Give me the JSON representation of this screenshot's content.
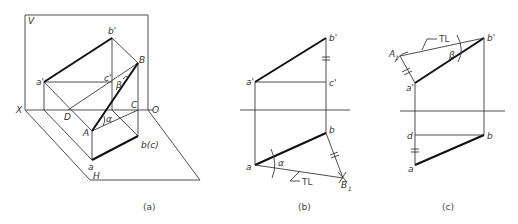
{
  "figure": {
    "panels": [
      {
        "id": "a",
        "caption": "(a)",
        "labels": {
          "V": "V",
          "H": "H",
          "X": "X",
          "O": "O",
          "a_prime": "a'",
          "b_prime": "b'",
          "c_prime": "c'",
          "A": "A",
          "B": "B",
          "C": "C",
          "D": "D",
          "a": "a",
          "bc": "b(c)",
          "alpha": "α",
          "beta": "β"
        }
      },
      {
        "id": "b",
        "caption": "(b)",
        "labels": {
          "a_prime": "a'",
          "b_prime": "b'",
          "c_prime": "c'",
          "a": "a",
          "b": "b",
          "B1": "B",
          "B1_sub": "1",
          "alpha": "α",
          "TL": "TL"
        }
      },
      {
        "id": "c",
        "caption": "(c)",
        "labels": {
          "A1": "A",
          "A1_sub": "1",
          "a_prime": "a'",
          "b_prime": "b'",
          "a": "a",
          "b": "b",
          "d": "d",
          "beta": "β",
          "TL": "TL"
        }
      }
    ],
    "colors": {
      "line": "#3a3a3a",
      "bold_line": "#111111",
      "text": "#333333"
    }
  }
}
